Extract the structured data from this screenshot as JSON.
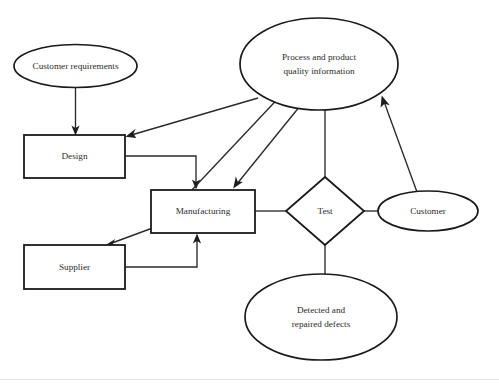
{
  "diagram": {
    "type": "flow-diagram",
    "background_color": "#ffffff",
    "stroke_color": "#1b1b1b",
    "text_color": "#2b2b2b",
    "nodes": {
      "customer_requirements": {
        "label": "Customer requirements",
        "shape": "ellipse",
        "cx": 75.5,
        "cy": 66,
        "rx": 61.5,
        "ry": 21.5
      },
      "process_quality_information": {
        "label_line1": "Process and product",
        "label_line2": "quality information",
        "shape": "ellipse",
        "cx": 319,
        "cy": 64,
        "rx": 79,
        "ry": 46
      },
      "design": {
        "label": "Design",
        "shape": "rectangle",
        "x": 24,
        "y": 135,
        "width": 101,
        "height": 43
      },
      "manufacturing": {
        "label": "Manufacturing",
        "shape": "rectangle",
        "x": 151,
        "y": 190,
        "width": 104,
        "height": 43
      },
      "supplier": {
        "label": "Supplier",
        "shape": "rectangle",
        "x": 24,
        "y": 245,
        "width": 101,
        "height": 44
      },
      "test": {
        "label": "Test",
        "shape": "diamond",
        "cx": 325,
        "cy": 211,
        "rx": 39,
        "ry": 34
      },
      "customer": {
        "label": "Customer",
        "shape": "ellipse",
        "cx": 428,
        "cy": 211,
        "rx": 50,
        "ry": 20
      },
      "detected_repaired_defects": {
        "label_line1": "Detected and",
        "label_line2": "repaired defects",
        "shape": "ellipse",
        "cx": 321,
        "cy": 317,
        "rx": 76,
        "ry": 43
      }
    },
    "edges": [
      {
        "name": "customer-requirements-to-design",
        "from": "customer_requirements",
        "to": "design",
        "arrow": "end"
      },
      {
        "name": "quality-information-to-design",
        "from": "process_quality_information",
        "to": "design",
        "arrow": "end"
      },
      {
        "name": "quality-information-to-manufacturing",
        "from": "process_quality_information",
        "to": "manufacturing",
        "arrow": "end"
      },
      {
        "name": "design-to-manufacturing",
        "from": "design",
        "to": "manufacturing",
        "arrow": "end"
      },
      {
        "name": "manufacturing-to-quality-information",
        "from": "manufacturing",
        "to": "process_quality_information",
        "arrow": "end"
      },
      {
        "name": "manufacturing-to-supplier",
        "from": "manufacturing",
        "to": "supplier",
        "arrow": "end"
      },
      {
        "name": "supplier-to-manufacturing",
        "from": "supplier",
        "to": "manufacturing",
        "arrow": "end"
      },
      {
        "name": "manufacturing-to-test",
        "from": "manufacturing",
        "to": "test",
        "arrow": "none"
      },
      {
        "name": "test-to-customer",
        "from": "test",
        "to": "customer",
        "arrow": "none"
      },
      {
        "name": "test-to-quality-information",
        "from": "test",
        "to": "process_quality_information",
        "arrow": "end"
      },
      {
        "name": "customer-to-quality-information",
        "from": "customer",
        "to": "process_quality_information",
        "arrow": "end"
      },
      {
        "name": "test-to-detected-defects",
        "from": "test",
        "to": "detected_repaired_defects",
        "arrow": "none"
      }
    ]
  }
}
